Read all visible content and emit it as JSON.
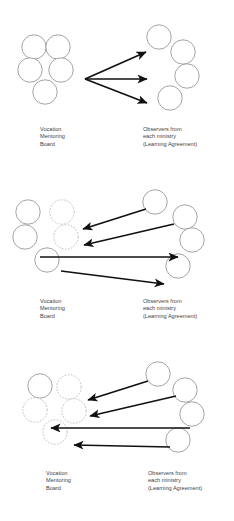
{
  "diagram": {
    "type": "process-progression-diagram",
    "panel_count": 3,
    "colors": {
      "background": "#ffffff",
      "circle_solid_stroke": "#8c8c8c",
      "circle_dashed_stroke": "#b4b4b4",
      "arrow": "#111111",
      "text": "#3f3f3f"
    },
    "labels": {
      "left_group": {
        "line1": "Vocation",
        "line2": "Mentoring",
        "line3": "Board"
      },
      "right_group": {
        "line1": "Observers from",
        "line2": "each ministry",
        "line3": "(Learning Agreement)"
      }
    },
    "panels": [
      {
        "id": "panel-stage-1",
        "left_group_label": {
          "line1": "Vocation",
          "line2": "Mentoring",
          "line3": "Board"
        },
        "right_group_label": {
          "line1": "Observers from",
          "line2": "each ministry",
          "line3": "(Learning Agreement)"
        },
        "left_nodes": [
          {
            "name": "left-node-top-left",
            "style": "solid"
          },
          {
            "name": "left-node-top-right",
            "style": "solid"
          },
          {
            "name": "left-node-middle-left",
            "style": "solid"
          },
          {
            "name": "left-node-middle-right",
            "style": "solid"
          },
          {
            "name": "left-node-bottom-center",
            "style": "solid"
          }
        ],
        "right_nodes": [
          {
            "name": "right-node-1",
            "style": "solid"
          },
          {
            "name": "right-node-2",
            "style": "solid"
          },
          {
            "name": "right-node-3",
            "style": "solid"
          },
          {
            "name": "right-node-4",
            "style": "solid"
          }
        ],
        "arrows": [
          {
            "name": "arrow-fan-upper",
            "direction": "left-to-right"
          },
          {
            "name": "arrow-fan-middle",
            "direction": "left-to-right"
          },
          {
            "name": "arrow-fan-lower",
            "direction": "left-to-right"
          }
        ]
      },
      {
        "id": "panel-stage-2",
        "left_group_label": {
          "line1": "Vocation",
          "line2": "Mentoring",
          "line3": "Board"
        },
        "right_group_label": {
          "line1": "Observers from",
          "line2": "each ministry",
          "line3": "(Learning Agreement)"
        },
        "left_nodes": [
          {
            "name": "left-node-top-left",
            "style": "solid"
          },
          {
            "name": "left-node-top-right",
            "style": "dashed"
          },
          {
            "name": "left-node-middle-left",
            "style": "solid"
          },
          {
            "name": "left-node-middle-right",
            "style": "dashed"
          },
          {
            "name": "left-node-bottom-center",
            "style": "solid"
          }
        ],
        "right_nodes": [
          {
            "name": "right-node-1",
            "style": "solid"
          },
          {
            "name": "right-node-2",
            "style": "solid"
          },
          {
            "name": "right-node-3",
            "style": "solid"
          },
          {
            "name": "right-node-4",
            "style": "solid"
          }
        ],
        "arrows": [
          {
            "name": "arrow-1",
            "direction": "right-to-left"
          },
          {
            "name": "arrow-2",
            "direction": "right-to-left"
          },
          {
            "name": "arrow-3",
            "direction": "left-to-right"
          },
          {
            "name": "arrow-4",
            "direction": "left-to-right"
          }
        ]
      },
      {
        "id": "panel-stage-3",
        "left_group_label": {
          "line1": "Vocation",
          "line2": "Mentoring",
          "line3": "Board"
        },
        "right_group_label": {
          "line1": "Observers from",
          "line2": "each ministry",
          "line3": "(Learning Agreement)"
        },
        "left_nodes": [
          {
            "name": "left-node-top-left",
            "style": "solid"
          },
          {
            "name": "left-node-top-right",
            "style": "dashed"
          },
          {
            "name": "left-node-middle-left",
            "style": "dashed"
          },
          {
            "name": "left-node-middle-right",
            "style": "dashed"
          },
          {
            "name": "left-node-bottom-center",
            "style": "dashed"
          }
        ],
        "right_nodes": [
          {
            "name": "right-node-1",
            "style": "solid"
          },
          {
            "name": "right-node-2",
            "style": "solid"
          },
          {
            "name": "right-node-3",
            "style": "solid"
          },
          {
            "name": "right-node-4",
            "style": "solid"
          }
        ],
        "arrows": [
          {
            "name": "arrow-1",
            "direction": "right-to-left"
          },
          {
            "name": "arrow-2",
            "direction": "right-to-left"
          },
          {
            "name": "arrow-3",
            "direction": "right-to-left"
          },
          {
            "name": "arrow-4",
            "direction": "right-to-left"
          }
        ]
      }
    ]
  }
}
